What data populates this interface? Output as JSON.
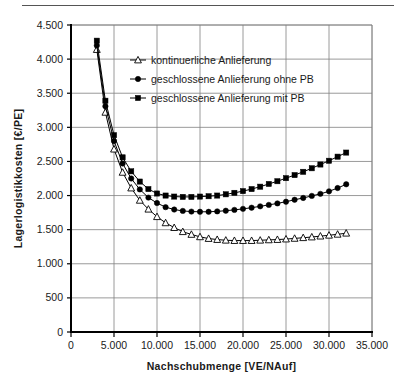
{
  "chart_data": {
    "type": "line",
    "title": "",
    "xlabel": "Nachschubmenge [VE/NAuf]",
    "ylabel": "Lagerlogistikkosten [€/PE]",
    "xlim": [
      0,
      35000
    ],
    "ylim": [
      0,
      4500
    ],
    "xticks": [
      0,
      5000,
      10000,
      15000,
      20000,
      25000,
      30000,
      35000
    ],
    "xticklabels": [
      "0",
      "5.000",
      "10.000",
      "15.000",
      "20.000",
      "25.000",
      "30.000",
      "35.000"
    ],
    "yticks": [
      0,
      500,
      1000,
      1500,
      2000,
      2500,
      3000,
      3500,
      4000,
      4500
    ],
    "yticklabels": [
      "0",
      "500",
      "1.000",
      "1.500",
      "2.000",
      "2.500",
      "3.000",
      "3.500",
      "4.000",
      "4.500"
    ],
    "grid": "both",
    "legend_position": "upper-center-inside",
    "x": [
      3000,
      4000,
      5000,
      6000,
      7000,
      8000,
      9000,
      10000,
      11000,
      12000,
      13000,
      14000,
      15000,
      16000,
      17000,
      18000,
      19000,
      20000,
      21000,
      22000,
      23000,
      24000,
      25000,
      26000,
      27000,
      28000,
      29000,
      30000,
      31000,
      32000
    ],
    "series": [
      {
        "name": "kontinuerliche Anlieferung",
        "marker": "triangle-open",
        "values": [
          4140,
          3220,
          2680,
          2340,
          2110,
          1930,
          1800,
          1690,
          1600,
          1530,
          1470,
          1430,
          1395,
          1370,
          1355,
          1345,
          1340,
          1340,
          1340,
          1345,
          1350,
          1355,
          1362,
          1372,
          1382,
          1392,
          1405,
          1418,
          1432,
          1448
        ]
      },
      {
        "name": "geschlossene Anlieferung ohne PB",
        "marker": "circle-filled",
        "values": [
          4200,
          3310,
          2800,
          2470,
          2250,
          2090,
          1970,
          1890,
          1830,
          1795,
          1775,
          1765,
          1762,
          1762,
          1768,
          1778,
          1790,
          1805,
          1822,
          1842,
          1863,
          1885,
          1910,
          1938,
          1965,
          1995,
          2025,
          2062,
          2110,
          2165
        ]
      },
      {
        "name": "geschlossene Anlieferung mit PB",
        "marker": "square-filled",
        "values": [
          4270,
          3390,
          2885,
          2560,
          2355,
          2205,
          2095,
          2030,
          2000,
          1985,
          1980,
          1980,
          1985,
          1990,
          2000,
          2018,
          2040,
          2065,
          2095,
          2130,
          2170,
          2210,
          2255,
          2300,
          2348,
          2400,
          2455,
          2510,
          2570,
          2630
        ]
      }
    ]
  },
  "legend": {
    "items": [
      {
        "label": "kontinuerliche Anlieferung"
      },
      {
        "label": "geschlossene Anlieferung ohne PB"
      },
      {
        "label": "geschlossene Anlieferung mit PB"
      }
    ]
  },
  "colors": {
    "axis": "#000000",
    "grid": "#808080",
    "series": "#000000",
    "background": "#ffffff"
  }
}
